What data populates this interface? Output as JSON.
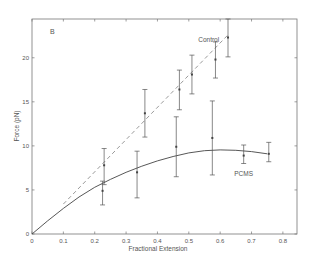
{
  "chart_data": {
    "type": "line",
    "panel_label": "B",
    "title": "",
    "xlabel": "Fractional Extension",
    "ylabel": "Force (pN)",
    "xlim": [
      0,
      0.845
    ],
    "ylim": [
      0,
      24.4
    ],
    "xticks": [
      0,
      0.1,
      0.2,
      0.3,
      0.4,
      0.5,
      0.6,
      0.7,
      0.8
    ],
    "xtick_labels": [
      "0",
      "0.1",
      "0.2",
      "0.3",
      "0.4",
      "0.5",
      "0.6",
      "0.7",
      "0.8"
    ],
    "yticks": [
      0,
      5,
      10,
      15,
      20
    ],
    "ytick_labels": [
      "0",
      "5",
      "10",
      "15",
      "20"
    ],
    "grid": false,
    "legend": "inline labels",
    "series": [
      {
        "name": "Control",
        "label_pos": [
          0.53,
          21.8
        ],
        "style": "dashed",
        "color": "#9a9a9a",
        "fit_line": {
          "x": [
            0.1,
            0.625
          ],
          "y": [
            3.4,
            22.6
          ]
        },
        "points": [
          {
            "x": 0.23,
            "y": 7.8,
            "err_low": 5.6,
            "err_high": 9.7
          },
          {
            "x": 0.36,
            "y": 13.7,
            "err_low": 11.0,
            "err_high": 16.4
          },
          {
            "x": 0.47,
            "y": 16.4,
            "err_low": 14.1,
            "err_high": 18.6
          },
          {
            "x": 0.51,
            "y": 18.1,
            "err_low": 15.9,
            "err_high": 20.3
          },
          {
            "x": 0.585,
            "y": 19.8,
            "err_low": 17.7,
            "err_high": 21.8
          },
          {
            "x": 0.625,
            "y": 22.3,
            "err_low": 20.1,
            "err_high": 24.4
          }
        ]
      },
      {
        "name": "PCMS",
        "label_pos": [
          0.645,
          6.6
        ],
        "style": "solid",
        "color": "#444444",
        "fit_curve": {
          "x": [
            0,
            0.05,
            0.1,
            0.15,
            0.2,
            0.25,
            0.3,
            0.35,
            0.4,
            0.45,
            0.5,
            0.55,
            0.6,
            0.65,
            0.7,
            0.75
          ],
          "y": [
            0,
            1.5,
            2.9,
            4.2,
            5.3,
            6.2,
            7.0,
            7.7,
            8.3,
            8.8,
            9.2,
            9.45,
            9.55,
            9.5,
            9.35,
            9.1
          ]
        },
        "points": [
          {
            "x": 0.225,
            "y": 4.9,
            "err_low": 3.3,
            "err_high": 6.0
          },
          {
            "x": 0.335,
            "y": 7.0,
            "err_low": 4.1,
            "err_high": 9.4
          },
          {
            "x": 0.46,
            "y": 9.9,
            "err_low": 6.5,
            "err_high": 13.3
          },
          {
            "x": 0.575,
            "y": 10.9,
            "err_low": 6.7,
            "err_high": 15.1
          },
          {
            "x": 0.675,
            "y": 8.9,
            "err_low": 8.0,
            "err_high": 10.1
          },
          {
            "x": 0.755,
            "y": 9.1,
            "err_low": 8.2,
            "err_high": 10.4
          }
        ]
      }
    ]
  }
}
